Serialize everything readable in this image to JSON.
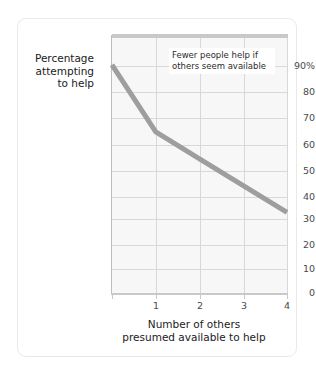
{
  "figure": {
    "background_color": "#ffffff",
    "frame_color": "#e9e9e9"
  },
  "annotation": {
    "text": "Fewer people help if others seem available"
  },
  "chart_data": {
    "type": "line",
    "title": "",
    "xlabel": "Number of others presumed available to help",
    "ylabel": "Percentage attempting to help",
    "x": [
      0,
      1,
      2,
      3,
      4
    ],
    "values": [
      85,
      60,
      50,
      40,
      30
    ],
    "series": [
      {
        "name": "Percentage attempting to help",
        "values": [
          85,
          60,
          50,
          40,
          30
        ],
        "color": "#9e9e9e"
      }
    ],
    "xlim": [
      0,
      4
    ],
    "ylim": [
      0,
      95
    ],
    "xticks": [
      0,
      1,
      2,
      3,
      4
    ],
    "xtick_labels": [
      "0",
      "1",
      "2",
      "3",
      "4"
    ],
    "yticks": [
      0,
      10,
      20,
      30,
      40,
      50,
      60,
      70,
      80,
      90
    ],
    "ytick_labels": [
      "0",
      "10",
      "20",
      "30",
      "40",
      "50",
      "60",
      "70",
      "80",
      "90%"
    ],
    "grid": true,
    "legend": "none",
    "annotations": [
      {
        "text": "Fewer people help if others seem available",
        "x": 1.4,
        "y": 88
      }
    ],
    "line_color": "#9e9e9e",
    "line_width": 5,
    "plot_background": "#f7f7f7",
    "grid_color": "#d8d8d8"
  },
  "axes": {
    "y_title_lines": [
      "Percentage",
      "attempting",
      "to help"
    ],
    "x_title_lines": [
      "Number of others",
      "presumed available to help"
    ],
    "y_labels": {
      "t90": "90%",
      "t80": "80",
      "t70": "70",
      "t60": "60",
      "t50": "50",
      "t40": "40",
      "t30": "30",
      "t20": "20",
      "t10": "10",
      "t0": "0"
    },
    "x_labels": {
      "t0": "0",
      "t1": "1",
      "t2": "2",
      "t3": "3",
      "t4": "4"
    }
  }
}
